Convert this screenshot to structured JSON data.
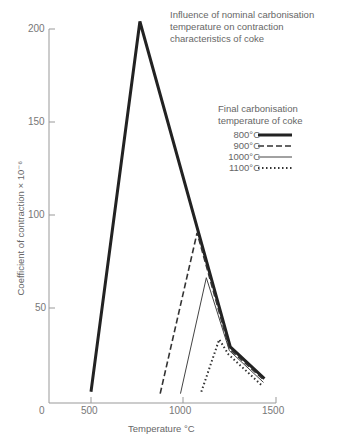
{
  "chart_data": {
    "type": "line",
    "title": "Influence of nominal carbonisation temperature on contraction characteristics of coke",
    "title_lines": [
      "Influence of nominal carbonisation",
      "temperature on contraction",
      "characteristics of coke"
    ],
    "xlabel": "Temperature °C",
    "ylabel": "Coefficient of contraction × 10⁻⁶",
    "x_ticks": [
      "0",
      "500",
      "1000",
      "1500"
    ],
    "y_ticks": [
      "50",
      "100",
      "150",
      "200"
    ],
    "xlim": [
      0,
      1500
    ],
    "ylim": [
      0,
      200
    ],
    "grid": false,
    "legend_title": "Final carbonisation temperature of coke",
    "legend_title_lines": [
      "Final carbonisation",
      "temperature of coke"
    ],
    "legend_position": "upper right",
    "series": [
      {
        "name": "800°C",
        "style": "thick-solid",
        "x": [
          500,
          765,
          1255,
          1440
        ],
        "y": [
          6,
          204,
          30,
          13
        ]
      },
      {
        "name": "900°C",
        "style": "dashed",
        "x": [
          875,
          1075,
          1250,
          1440
        ],
        "y": [
          5,
          91,
          29,
          12
        ]
      },
      {
        "name": "1000°C",
        "style": "thin-solid",
        "x": [
          985,
          1125,
          1250,
          1435
        ],
        "y": [
          5,
          67,
          28,
          11
        ]
      },
      {
        "name": "1100°C",
        "style": "dotted",
        "x": [
          1098,
          1195,
          1245,
          1430
        ],
        "y": [
          6,
          34,
          26,
          9
        ]
      }
    ]
  }
}
